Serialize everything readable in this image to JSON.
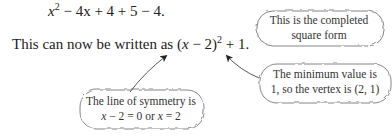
{
  "equations": {
    "line1": {
      "x": "x",
      "exp": "2",
      "rest": " − 4x + 4 + 5 − 4."
    },
    "line2": {
      "prefix": "This can now be written as ",
      "open": "(",
      "x": "x",
      "minus": " − 2)",
      "exp": "2",
      "suffix": " + 1."
    }
  },
  "annotations": {
    "completed_square": {
      "line1": "This is the completed",
      "line2": "square form"
    },
    "minimum_value": {
      "line1": "The minimum value is",
      "line2": "1, so the vertex is (2, 1)"
    },
    "line_of_symmetry": {
      "line1": "The line of symmetry is",
      "line2_a": "x",
      "line2_b": " − 2 = 0  or ",
      "line2_c": "x",
      "line2_d": " = 2"
    }
  }
}
